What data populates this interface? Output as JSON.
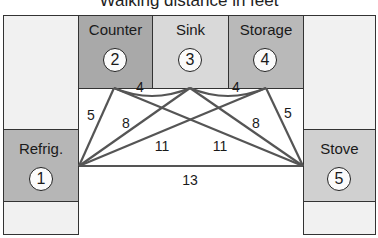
{
  "title": "Walking distance in feet",
  "colors": {
    "border": "#333333",
    "blank": "#f1f1f1",
    "refrig": "#b6b6b6",
    "counter": "#a9a9a9",
    "sink": "#d9d9d9",
    "storage": "#b9b9b9",
    "stove": "#d0d0d0",
    "line": "#555555"
  },
  "stations": [
    {
      "id": 1,
      "name": "Refrig.",
      "number": "1"
    },
    {
      "id": 2,
      "name": "Counter",
      "number": "2"
    },
    {
      "id": 3,
      "name": "Sink",
      "number": "3"
    },
    {
      "id": 4,
      "name": "Storage",
      "number": "4"
    },
    {
      "id": 5,
      "name": "Stove",
      "number": "5"
    }
  ],
  "distances": [
    {
      "from": 2,
      "to": 3,
      "label": "4"
    },
    {
      "from": 3,
      "to": 4,
      "label": "4"
    },
    {
      "from": 1,
      "to": 2,
      "label": "5"
    },
    {
      "from": 4,
      "to": 5,
      "label": "5"
    },
    {
      "from": 1,
      "to": 3,
      "label": "8"
    },
    {
      "from": 3,
      "to": 5,
      "label": "8"
    },
    {
      "from": 1,
      "to": 4,
      "label": "11"
    },
    {
      "from": 2,
      "to": 5,
      "label": "11"
    },
    {
      "from": 1,
      "to": 5,
      "label": "13"
    }
  ]
}
